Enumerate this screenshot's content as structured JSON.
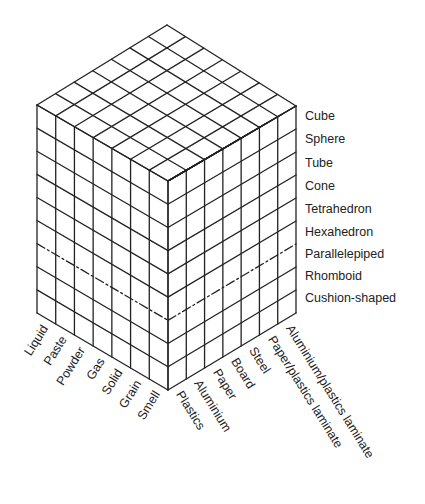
{
  "diagram": {
    "title": "",
    "geometry": {
      "top": [
        167,
        25
      ],
      "left": [
        37,
        105
      ],
      "right": [
        296,
        106
      ],
      "front_top": [
        168,
        181
      ],
      "left_bottom": [
        37,
        313
      ],
      "right_bottom": [
        296,
        313
      ],
      "front_bottom": [
        168,
        390
      ],
      "columns_left": 7,
      "columns_right": 7,
      "rows": 9,
      "dashed_row_boundary": 6,
      "line_color": "#222222"
    },
    "row_labels": [
      {
        "label": "Cube",
        "y": 110
      },
      {
        "label": "Sphere",
        "y": 133
      },
      {
        "label": "Tube",
        "y": 157
      },
      {
        "label": "Cone",
        "y": 180
      },
      {
        "label": "Tetrahedron",
        "y": 203
      },
      {
        "label": "Hexahedron",
        "y": 226
      },
      {
        "label": "Parallelepiped",
        "y": 248
      },
      {
        "label": "Rhomboid",
        "y": 270
      },
      {
        "label": "Cushion-shaped",
        "y": 292
      }
    ],
    "left_face_labels": [
      "Liquid",
      "Paste",
      "Powder",
      "Gas",
      "Solid",
      "Grain",
      "Smell"
    ],
    "right_face_labels": [
      "Plastics",
      "Aluminium",
      "Paper",
      "Board",
      "Steel",
      "Paper/plastics laminate",
      "Aluminium/plastics laminate"
    ]
  }
}
